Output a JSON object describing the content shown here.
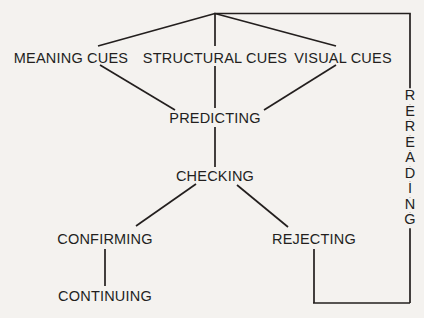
{
  "diagram": {
    "background_color": "#f4f2ef",
    "line_color": "#231f1e",
    "text_color": "#231f1e",
    "nodes": [
      {
        "id": "meaning-cues",
        "label": "MEANING CUES",
        "x": 71,
        "y": 58
      },
      {
        "id": "structural-cues",
        "label": "STRUCTURAL CUES",
        "x": 215,
        "y": 58
      },
      {
        "id": "visual-cues",
        "label": "VISUAL CUES",
        "x": 343,
        "y": 58
      },
      {
        "id": "predicting",
        "label": "PREDICTING",
        "x": 215,
        "y": 118
      },
      {
        "id": "checking",
        "label": "CHECKING",
        "x": 215,
        "y": 176
      },
      {
        "id": "confirming",
        "label": "CONFIRMING",
        "x": 105,
        "y": 239
      },
      {
        "id": "rejecting",
        "label": "REJECTING",
        "x": 314,
        "y": 239
      },
      {
        "id": "continuing",
        "label": "CONTINUING",
        "x": 105,
        "y": 296
      }
    ],
    "vertical_node": {
      "id": "rereading",
      "label": "REREADING",
      "letters": [
        "R",
        "E",
        "R",
        "E",
        "A",
        "D",
        "I",
        "N",
        "G"
      ],
      "x": 410,
      "y": 158
    },
    "edges": [
      {
        "id": "apex-to-meaning-cues",
        "from": "apex",
        "to": "meaning-cues"
      },
      {
        "id": "apex-to-structural-cues",
        "from": "apex",
        "to": "structural-cues"
      },
      {
        "id": "apex-to-visual-cues",
        "from": "apex",
        "to": "visual-cues"
      },
      {
        "id": "meaning-cues-to-predicting",
        "from": "meaning-cues",
        "to": "predicting"
      },
      {
        "id": "structural-cues-to-predicting",
        "from": "structural-cues",
        "to": "predicting"
      },
      {
        "id": "visual-cues-to-predicting",
        "from": "visual-cues",
        "to": "predicting"
      },
      {
        "id": "predicting-to-checking",
        "from": "predicting",
        "to": "checking"
      },
      {
        "id": "checking-to-confirming",
        "from": "checking",
        "to": "confirming"
      },
      {
        "id": "checking-to-rejecting",
        "from": "checking",
        "to": "rejecting"
      },
      {
        "id": "confirming-to-continuing",
        "from": "confirming",
        "to": "continuing"
      },
      {
        "id": "rejecting-to-rereading",
        "from": "rejecting",
        "to": "rereading"
      },
      {
        "id": "rereading-to-apex",
        "from": "rereading",
        "to": "apex"
      }
    ]
  }
}
